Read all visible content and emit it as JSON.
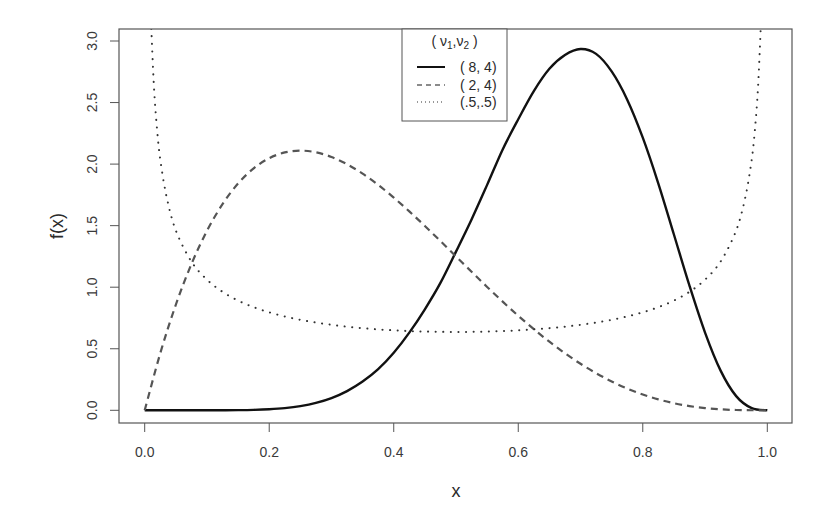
{
  "chart_data": {
    "type": "line",
    "title": "",
    "xlabel": "x",
    "ylabel": "f(x)",
    "xlim": [
      0.0,
      1.0
    ],
    "ylim": [
      0.0,
      3.0
    ],
    "grid": false,
    "legend_position": "top-center",
    "x_ticks": [
      "0.0",
      "0.2",
      "0.4",
      "0.6",
      "0.8",
      "1.0"
    ],
    "y_ticks": [
      "0.0",
      "0.5",
      "1.0",
      "1.5",
      "2.0",
      "2.5",
      "3.0"
    ],
    "legend": {
      "title_main": "( ν",
      "title_sub1": "1",
      "title_mid": ",ν",
      "title_sub2": "2",
      "title_end": " )",
      "entries": [
        {
          "label": "( 8, 4)",
          "style": "solid"
        },
        {
          "label": "( 2, 4)",
          "style": "dashed"
        },
        {
          "label": "(.5,.5)",
          "style": "dotted"
        }
      ]
    },
    "x": [
      0,
      0.025,
      0.05,
      0.075,
      0.1,
      0.125,
      0.15,
      0.175,
      0.2,
      0.225,
      0.25,
      0.275,
      0.3,
      0.325,
      0.35,
      0.375,
      0.4,
      0.425,
      0.45,
      0.475,
      0.5,
      0.525,
      0.55,
      0.575,
      0.6,
      0.625,
      0.65,
      0.675,
      0.7,
      0.725,
      0.75,
      0.775,
      0.8,
      0.825,
      0.85,
      0.875,
      0.9,
      0.925,
      0.95,
      0.975,
      1.0
    ],
    "series": [
      {
        "name": "( 8, 4)",
        "style": "solid",
        "color": "#111111",
        "values": [
          0,
          0,
          0,
          0,
          0.0001,
          0.0004,
          0.0014,
          0.0037,
          0.0087,
          0.0179,
          0.034,
          0.0599,
          0.099,
          0.1558,
          0.2332,
          0.3338,
          0.4671,
          0.6306,
          0.8206,
          1.0348,
          1.2891,
          1.5502,
          1.8312,
          2.1195,
          2.3647,
          2.5932,
          2.7743,
          2.8861,
          2.9351,
          2.8955,
          2.753,
          2.5236,
          2.2147,
          1.8423,
          1.4282,
          1.0124,
          0.6314,
          0.3224,
          0.1152,
          0.0173,
          0
        ]
      },
      {
        "name": "( 2, 4)",
        "style": "dashed",
        "color": "#555555",
        "values": [
          0,
          0.4634,
          0.8574,
          1.1872,
          1.458,
          1.6748,
          1.8424,
          1.9653,
          2.048,
          2.0947,
          2.1094,
          2.0959,
          2.058,
          1.9991,
          1.9224,
          1.8311,
          1.728,
          1.6159,
          1.4974,
          1.3747,
          1.25,
          1.1253,
          1.0023,
          0.8828,
          0.768,
          0.6592,
          0.5574,
          0.4634,
          0.378,
          0.3016,
          0.2344,
          0.1766,
          0.128,
          0.0884,
          0.0574,
          0.0342,
          0.018,
          0.0078,
          0.0024,
          0.0003,
          0
        ]
      },
      {
        "name": "(.5,.5)",
        "style": "dotted",
        "color": "#333333",
        "x": [
          0.0106,
          0.015,
          0.02,
          0.025,
          0.035,
          0.05,
          0.075,
          0.1,
          0.125,
          0.15,
          0.175,
          0.2,
          0.225,
          0.25,
          0.275,
          0.3,
          0.325,
          0.35,
          0.375,
          0.4,
          0.425,
          0.45,
          0.475,
          0.5,
          0.525,
          0.55,
          0.575,
          0.6,
          0.625,
          0.65,
          0.675,
          0.7,
          0.725,
          0.75,
          0.775,
          0.8,
          0.825,
          0.85,
          0.875,
          0.9,
          0.925,
          0.95,
          0.965,
          0.975,
          0.98,
          0.985,
          0.9894
        ],
        "values": [
          3.1,
          2.615,
          2.274,
          2.039,
          1.738,
          1.4605,
          1.2085,
          1.061,
          0.9625,
          0.8914,
          0.8377,
          0.7958,
          0.7623,
          0.7351,
          0.7129,
          0.6946,
          0.6796,
          0.6674,
          0.6575,
          0.6497,
          0.6439,
          0.6398,
          0.6374,
          0.6366,
          0.6374,
          0.6398,
          0.6439,
          0.6497,
          0.6575,
          0.6674,
          0.6796,
          0.6946,
          0.7129,
          0.7351,
          0.7623,
          0.7958,
          0.8377,
          0.8914,
          0.9625,
          1.061,
          1.2085,
          1.4605,
          1.738,
          2.039,
          2.274,
          2.615,
          3.1
        ]
      }
    ]
  }
}
